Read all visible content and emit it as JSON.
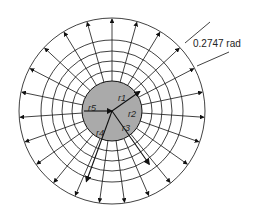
{
  "diagram": {
    "angle_label": "0.2747 rad",
    "radius_labels": [
      "r1",
      "r2",
      "r3",
      "r4",
      "r5"
    ],
    "center": [
      112,
      111
    ],
    "core_radius": 30,
    "ring_radii": [
      40,
      50,
      60,
      71
    ],
    "outer_radius": 93,
    "ray_count": 23,
    "colors": {
      "core": "#aaaaaa",
      "line": "#111111"
    }
  }
}
